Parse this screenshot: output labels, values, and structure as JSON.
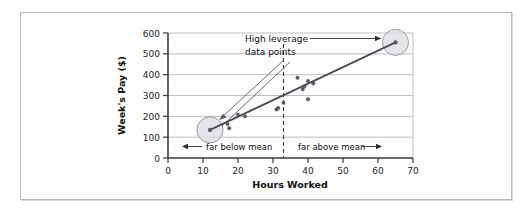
{
  "figure": {
    "background_color": "#ffffff",
    "frame_color": "#b9b9bc"
  },
  "chart_data": {
    "type": "scatter",
    "title": "",
    "xlabel": "Hours Worked",
    "ylabel": "Week's Pay ($)",
    "xlim": [
      0,
      70
    ],
    "ylim": [
      0,
      600
    ],
    "xticks": [
      0,
      10,
      20,
      30,
      40,
      50,
      60,
      70
    ],
    "yticks": [
      0,
      100,
      200,
      300,
      400,
      500,
      600
    ],
    "xtick_labels": [
      "0",
      "10",
      "20",
      "30",
      "40",
      "50",
      "60",
      "70"
    ],
    "ytick_labels": [
      "0",
      "100",
      "200",
      "300",
      "400",
      "500",
      "600"
    ],
    "grid": "horizontal",
    "legend": "none",
    "points": [
      {
        "x": 12,
        "y": 135,
        "high_leverage": true
      },
      {
        "x": 17,
        "y": 163
      },
      {
        "x": 17.5,
        "y": 143
      },
      {
        "x": 20,
        "y": 208
      },
      {
        "x": 22,
        "y": 200
      },
      {
        "x": 31,
        "y": 233
      },
      {
        "x": 31.5,
        "y": 240
      },
      {
        "x": 33,
        "y": 265
      },
      {
        "x": 37,
        "y": 385
      },
      {
        "x": 38.5,
        "y": 330
      },
      {
        "x": 39,
        "y": 345
      },
      {
        "x": 40,
        "y": 370
      },
      {
        "x": 40,
        "y": 282
      },
      {
        "x": 41.5,
        "y": 358
      },
      {
        "x": 65,
        "y": 555,
        "high_leverage": true
      }
    ],
    "fit_line": {
      "x_start": 12,
      "y_start": 135,
      "x_end": 65,
      "y_end": 555
    },
    "mean_line": {
      "x": 33,
      "style": "dashed"
    },
    "highlight_circles": [
      {
        "x": 12,
        "y": 135,
        "radius_px": 13
      },
      {
        "x": 65,
        "y": 555,
        "radius_px": 13
      }
    ],
    "annotations": [
      {
        "id": "high-leverage",
        "text_line1": "High leverage",
        "text_line2": "data points"
      },
      {
        "id": "far-below-mean",
        "text": "far below mean",
        "arrow": "left"
      },
      {
        "id": "far-above-mean",
        "text": "far above mean",
        "arrow": "right"
      }
    ]
  },
  "labels": {
    "x_axis_title": "Hours Worked",
    "y_axis_title": "Week's Pay ($)",
    "annotation_line1": "High leverage",
    "annotation_line2": "data points",
    "far_below": "far below mean",
    "far_above": "far above mean",
    "arrow_left": "←",
    "arrow_right": "→"
  }
}
